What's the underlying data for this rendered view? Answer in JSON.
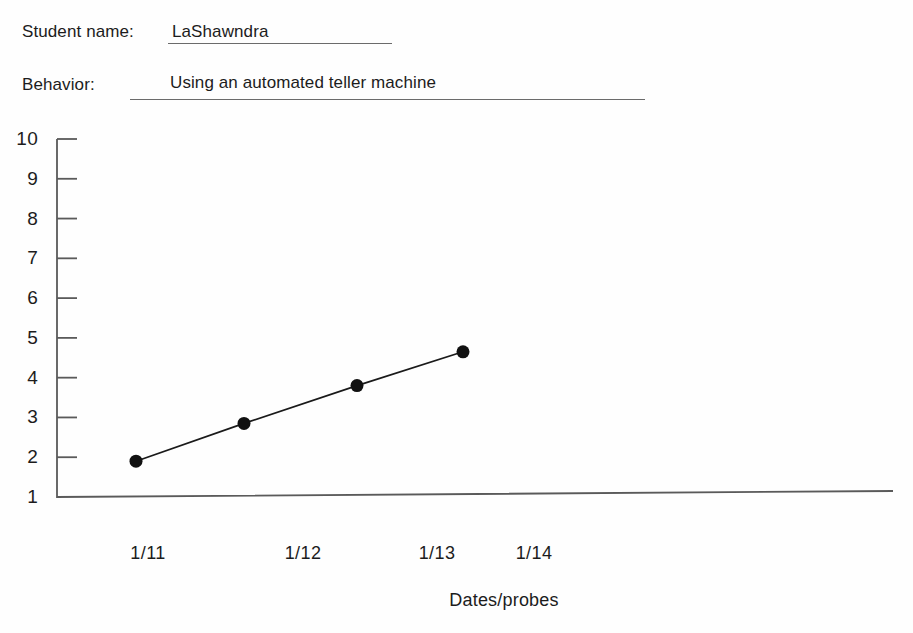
{
  "form": {
    "student_name_label": "Student name:",
    "student_name_value": "LaShawndra",
    "behavior_label": "Behavior:",
    "behavior_value": "Using an automated teller machine"
  },
  "chart_data": {
    "type": "line",
    "title": "",
    "xlabel": "Dates/probes",
    "ylabel": "",
    "categories": [
      "1/11",
      "1/12",
      "1/13",
      "1/14"
    ],
    "x_tick_labels": [
      "1/11",
      "1/12",
      "1/13",
      "1/14"
    ],
    "y_tick_labels": [
      "10",
      "9",
      "8",
      "7",
      "6",
      "5",
      "4",
      "3",
      "2",
      "1"
    ],
    "ylim": [
      1,
      10
    ],
    "grid": false,
    "legend": "none",
    "marker": "filled-circle",
    "series": [
      {
        "name": "Probe data",
        "x": [
          "1/11",
          "",
          "1/12",
          "1/13"
        ],
        "values": [
          1.9,
          2.85,
          3.8,
          4.65
        ]
      }
    ],
    "points": [
      {
        "label": "probe-1",
        "value": 1.9
      },
      {
        "label": "probe-2",
        "value": 2.85
      },
      {
        "label": "probe-3",
        "value": 3.8
      },
      {
        "label": "probe-4",
        "value": 4.65
      }
    ],
    "line_color": "#1a1a1a",
    "marker_color": "#111111",
    "axis_color": "#555555"
  }
}
